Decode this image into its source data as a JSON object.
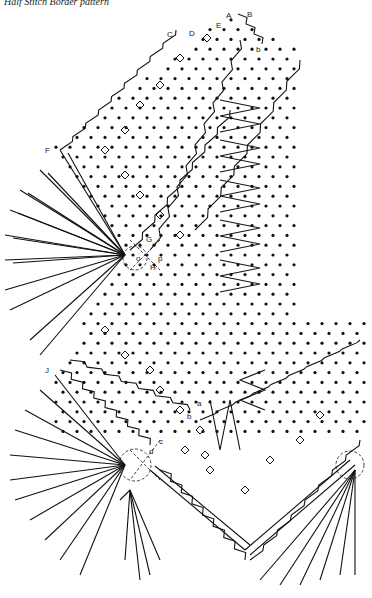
{
  "title": "Half Stitch Border pattern",
  "labels": {
    "A": "A",
    "B": "B",
    "C": "C",
    "D": "D",
    "E": "E",
    "F": "F",
    "G": "G",
    "H": "H",
    "J": "J",
    "o": "o",
    "p": "p",
    "a": "a",
    "b": "b",
    "b2": "b",
    "c": "c",
    "d": "d"
  },
  "colors": {
    "ink": "#111111",
    "background": "#ffffff"
  }
}
